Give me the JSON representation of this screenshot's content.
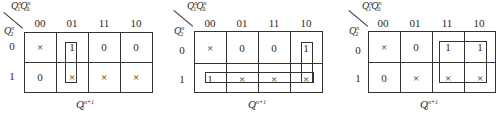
{
  "maps": [
    {
      "title_var": "Q",
      "title_sub": "2",
      "title_sup": "n+1",
      "col_var_label": {
        "a": "Q",
        "a_sub": "1",
        "a_sup": "n",
        "b": "Q",
        "b_sub": "0",
        "b_sup": "n"
      },
      "row_var_label": {
        "v": "Q",
        "v_sub": "2",
        "v_sup": "n"
      },
      "col_headers": [
        "00",
        "01",
        "11",
        "10"
      ],
      "row_headers": [
        "0",
        "1"
      ],
      "cells": [
        [
          "×",
          "1",
          "0",
          "0"
        ],
        [
          "0",
          "×",
          "×",
          "×"
        ]
      ]
    },
    {
      "title_var": "Q",
      "title_sub": "1",
      "title_sup": "n+1",
      "col_var_label": {
        "a": "Q",
        "a_sub": "1",
        "a_sup": "n",
        "b": "Q",
        "b_sub": "0",
        "b_sup": "n"
      },
      "row_var_label": {
        "v": "Q",
        "v_sub": "2",
        "v_sup": "n"
      },
      "col_headers": [
        "00",
        "01",
        "11",
        "10"
      ],
      "row_headers": [
        "0",
        "1"
      ],
      "cells": [
        [
          "×",
          "0",
          "0",
          "1"
        ],
        [
          "1",
          "×",
          "×",
          "×"
        ]
      ]
    },
    {
      "title_var": "Q",
      "title_sub": "0",
      "title_sup": "n+1",
      "col_var_label": {
        "a": "Q",
        "a_sub": "1",
        "a_sup": "n",
        "b": "Q",
        "b_sub": "0",
        "b_sup": "n"
      },
      "row_var_label": {
        "v": "Q",
        "v_sub": "2",
        "v_sup": "n"
      },
      "col_headers": [
        "00",
        "01",
        "11",
        "10"
      ],
      "row_headers": [
        "0",
        "1"
      ],
      "cells": [
        [
          "×",
          "0",
          "1",
          "1"
        ],
        [
          "0",
          "×",
          "×",
          "×"
        ]
      ]
    }
  ]
}
